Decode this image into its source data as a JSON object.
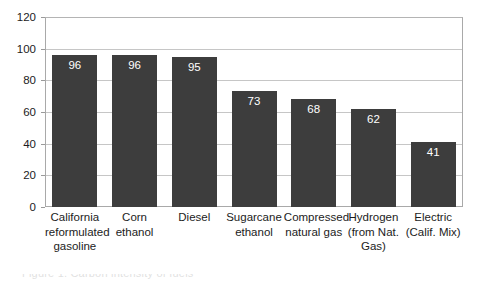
{
  "chart_data": {
    "type": "bar",
    "title": "",
    "subtitle": "",
    "xlabel": "",
    "ylabel": "",
    "ylim": [
      0,
      120
    ],
    "ytick_step": 20,
    "yticks": [
      0,
      20,
      40,
      60,
      80,
      100,
      120
    ],
    "ytick_labels": [
      "0",
      "20",
      "40",
      "60",
      "80",
      "100",
      "120"
    ],
    "grid": true,
    "grid_axis": "y",
    "legend": false,
    "legend_position": "none",
    "categories": [
      "California reformulated gasoline",
      "Corn ethanol",
      "Diesel",
      "Sugarcane ethanol",
      "Compressed natural gas",
      "Hydrogen (from Nat. Gas)",
      "Electric (Calif. Mix)"
    ],
    "category_label_lines": [
      [
        "California",
        "reformulated",
        "gasoline"
      ],
      [
        "Corn",
        "ethanol"
      ],
      [
        "Diesel"
      ],
      [
        "Sugarcane",
        "ethanol"
      ],
      [
        "Compressed",
        "natural gas"
      ],
      [
        "Hydrogen",
        "(from Nat.",
        "Gas)"
      ],
      [
        "Electric",
        "(Calif. Mix)"
      ]
    ],
    "values": [
      96,
      96,
      95,
      73,
      68,
      62,
      41
    ],
    "value_labels": [
      "96",
      "96",
      "95",
      "73",
      "68",
      "62",
      "41"
    ],
    "bar_color": "#3d3d3d",
    "value_label_color": "#ffffff",
    "axis_color": "#a9a9a9",
    "gridline_color": "#c6c6c6",
    "background_color": "#ffffff"
  },
  "artifact": {
    "bottom_strip_text": "Figure 1. Carbon intensity of fuels"
  }
}
